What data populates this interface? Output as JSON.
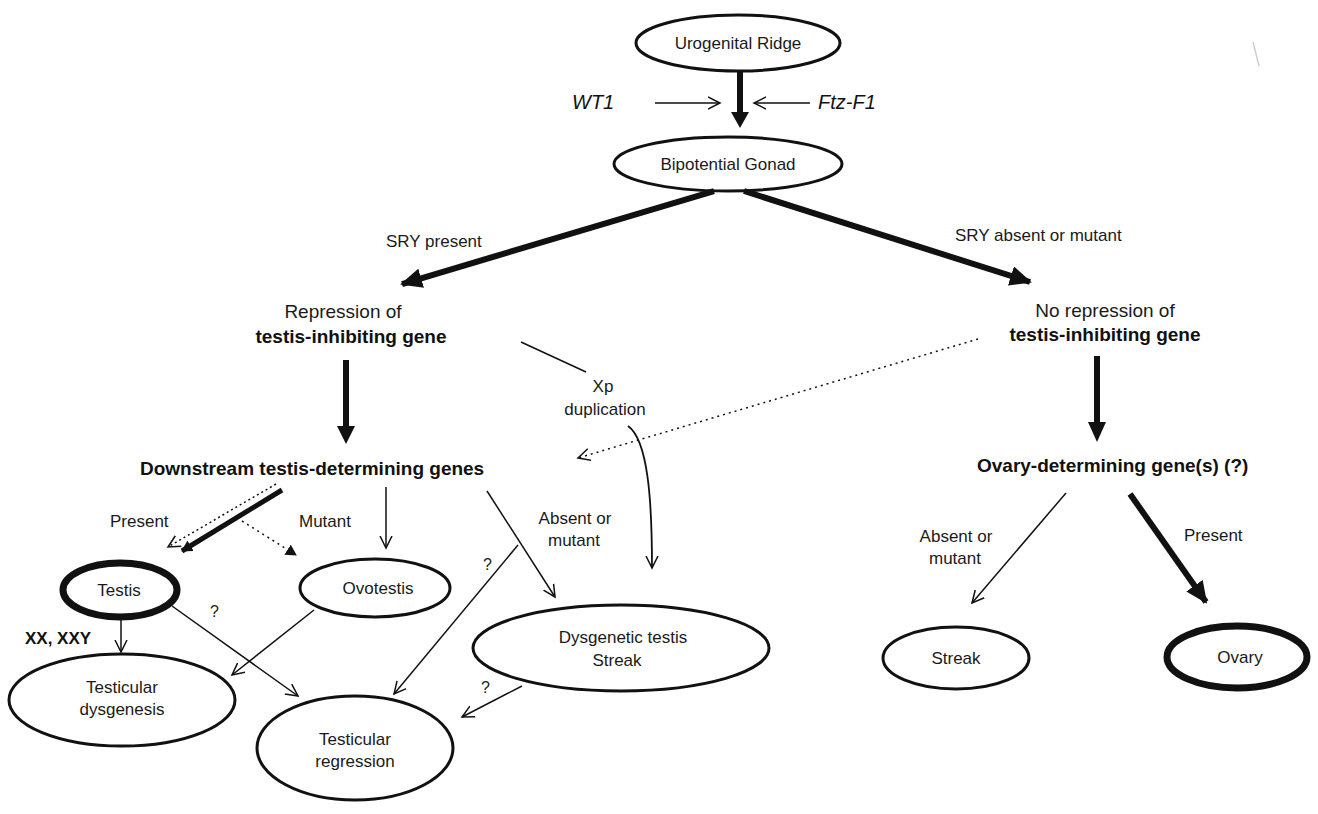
{
  "nodes": {
    "urogenital_ridge": "Urogenital Ridge",
    "bipotential_gonad": "Bipotential Gonad",
    "repression_line1": "Repression of",
    "repression_line2": "testis-inhibiting gene",
    "no_repression_line1": "No repression of",
    "no_repression_line2": "testis-inhibiting gene",
    "downstream": "Downstream testis-determining genes",
    "ovary_determining": "Ovary-determining gene(s)  (?)",
    "testis": "Testis",
    "ovotestis": "Ovotestis",
    "dysgenetic_line1": "Dysgenetic testis",
    "dysgenetic_line2": "Streak",
    "testicular_dysgenesis_line1": "Testicular",
    "testicular_dysgenesis_line2": "dysgenesis",
    "testicular_regression_line1": "Testicular",
    "testicular_regression_line2": "regression",
    "streak": "Streak",
    "ovary": "Ovary"
  },
  "labels": {
    "wt1": "WT1",
    "ftz_f1": "Ftz-F1",
    "sry_present": "SRY  present",
    "sry_absent": "SRY  absent or mutant",
    "xp_line1": "Xp",
    "xp_line2": "duplication",
    "present_left": "Present",
    "mutant": "Mutant",
    "absent_mutant_mid_line1": "Absent or",
    "absent_mutant_mid_line2": "mutant",
    "absent_mutant_right_line1": "Absent or",
    "absent_mutant_right_line2": "mutant",
    "present_right": "Present",
    "xx_xxy": "XX, XXY",
    "question_1": "?",
    "question_2": "?",
    "question_3": "?"
  }
}
